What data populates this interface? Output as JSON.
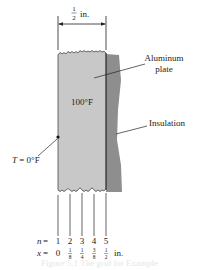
{
  "diagram": {
    "dimension": {
      "numerator": "1",
      "denominator": "2",
      "unit": "in."
    },
    "plate": {
      "label_line1": "Aluminum",
      "label_line2": "plate",
      "temperature": "100°F",
      "color": "#c8c8c8"
    },
    "insulation": {
      "label": "Insulation",
      "color": "#8e8e8e"
    },
    "boundary": {
      "var": "T",
      "eq": " = 0°F"
    },
    "nodes": {
      "n_prefix": "n",
      "x_prefix": "x",
      "eq": " = ",
      "n_values": [
        "1",
        "2",
        "3",
        "4",
        "5"
      ],
      "x_values": [
        {
          "whole": "0"
        },
        {
          "num": "1",
          "den": "8"
        },
        {
          "num": "1",
          "den": "4"
        },
        {
          "num": "3",
          "den": "8"
        },
        {
          "num": "1",
          "den": "2"
        }
      ],
      "x_unit": "in."
    },
    "caption": "Figure 5.1   The grid for Example"
  }
}
